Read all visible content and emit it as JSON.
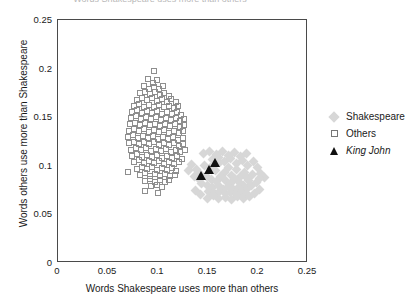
{
  "chart_data": {
    "type": "scatter",
    "title": "Words Shakespeare uses more than others",
    "xlabel": "Words Shakespeare uses more than others",
    "ylabel": "Words others use more than Shakespeare",
    "xlim": [
      0,
      0.25
    ],
    "ylim": [
      0,
      0.25
    ],
    "xticks": [
      "0",
      "0.05",
      "0.1",
      "0.15",
      "0.2",
      "0.25"
    ],
    "xtick_values": [
      0,
      0.05,
      0.1,
      0.15,
      0.2,
      0.25
    ],
    "yticks": [
      "0",
      "0.05",
      "0.1",
      "0.15",
      "0.2",
      "0.25"
    ],
    "ytick_values": [
      0,
      0.05,
      0.1,
      0.15,
      0.2,
      0.25
    ],
    "grid": false,
    "legend_position": "right",
    "series": [
      {
        "name": "Shakespeare",
        "marker": "diamond",
        "color": "#d7d7d7",
        "points": [
          [
            0.1465,
            0.1005
          ],
          [
            0.152,
            0.098
          ],
          [
            0.1575,
            0.0955
          ],
          [
            0.161,
            0.103
          ],
          [
            0.166,
            0.093
          ],
          [
            0.17,
            0.0985
          ],
          [
            0.1735,
            0.0905
          ],
          [
            0.178,
            0.096
          ],
          [
            0.182,
            0.089
          ],
          [
            0.186,
            0.0935
          ],
          [
            0.1895,
            0.0865
          ],
          [
            0.194,
            0.091
          ],
          [
            0.138,
            0.096
          ],
          [
            0.1425,
            0.0915
          ],
          [
            0.148,
            0.0885
          ],
          [
            0.153,
            0.086
          ],
          [
            0.158,
            0.0835
          ],
          [
            0.1625,
            0.089
          ],
          [
            0.1675,
            0.0845
          ],
          [
            0.172,
            0.082
          ],
          [
            0.1765,
            0.087
          ],
          [
            0.181,
            0.0825
          ],
          [
            0.1855,
            0.08
          ],
          [
            0.19,
            0.0845
          ],
          [
            0.143,
            0.082
          ],
          [
            0.149,
            0.0795
          ],
          [
            0.1545,
            0.0775
          ],
          [
            0.16,
            0.08
          ],
          [
            0.165,
            0.076
          ],
          [
            0.17,
            0.0785
          ],
          [
            0.175,
            0.0755
          ],
          [
            0.18,
            0.078
          ],
          [
            0.1845,
            0.0745
          ],
          [
            0.189,
            0.077
          ],
          [
            0.1935,
            0.08
          ],
          [
            0.198,
            0.083
          ],
          [
            0.15,
            0.0735
          ],
          [
            0.156,
            0.072
          ],
          [
            0.1615,
            0.074
          ],
          [
            0.167,
            0.0715
          ],
          [
            0.1725,
            0.073
          ],
          [
            0.178,
            0.0705
          ],
          [
            0.1835,
            0.0725
          ],
          [
            0.1885,
            0.07
          ],
          [
            0.1545,
            0.106
          ],
          [
            0.1605,
            0.1085
          ],
          [
            0.1665,
            0.1045
          ],
          [
            0.1725,
            0.107
          ],
          [
            0.1785,
            0.102
          ],
          [
            0.184,
            0.1055
          ],
          [
            0.1895,
            0.1005
          ],
          [
            0.195,
            0.104
          ],
          [
            0.199,
            0.0985
          ],
          [
            0.2025,
            0.0925
          ],
          [
            0.206,
            0.088
          ],
          [
            0.201,
            0.0865
          ],
          [
            0.1335,
            0.1015
          ],
          [
            0.13,
            0.0955
          ],
          [
            0.1365,
            0.089
          ],
          [
            0.141,
            0.0855
          ],
          [
            0.1455,
            0.113
          ],
          [
            0.1515,
            0.115
          ],
          [
            0.158,
            0.112
          ],
          [
            0.164,
            0.1145
          ],
          [
            0.1705,
            0.111
          ],
          [
            0.1765,
            0.1135
          ],
          [
            0.1825,
            0.1095
          ],
          [
            0.188,
            0.1125
          ],
          [
            0.1605,
            0.066
          ],
          [
            0.167,
            0.0675
          ],
          [
            0.1735,
            0.0655
          ],
          [
            0.1795,
            0.068
          ],
          [
            0.1855,
            0.066
          ],
          [
            0.191,
            0.0685
          ],
          [
            0.1965,
            0.072
          ],
          [
            0.2015,
            0.076
          ],
          [
            0.149,
            0.066
          ],
          [
            0.1555,
            0.069
          ],
          [
            0.142,
            0.0705
          ],
          [
            0.137,
            0.0745
          ]
        ]
      },
      {
        "name": "Others",
        "marker": "open-square",
        "color": "#8e8e8e",
        "points": [
          [
            0.0955,
            0.1975
          ],
          [
            0.09,
            0.189
          ],
          [
            0.0945,
            0.1855
          ],
          [
            0.099,
            0.188
          ],
          [
            0.0855,
            0.182
          ],
          [
            0.0905,
            0.1795
          ],
          [
            0.0955,
            0.181
          ],
          [
            0.1005,
            0.1785
          ],
          [
            0.105,
            0.1825
          ],
          [
            0.0815,
            0.1745
          ],
          [
            0.0865,
            0.176
          ],
          [
            0.0915,
            0.1735
          ],
          [
            0.0965,
            0.1755
          ],
          [
            0.1015,
            0.1725
          ],
          [
            0.106,
            0.175
          ],
          [
            0.1105,
            0.172
          ],
          [
            0.0785,
            0.168
          ],
          [
            0.0835,
            0.17
          ],
          [
            0.0885,
            0.1675
          ],
          [
            0.0935,
            0.1695
          ],
          [
            0.0985,
            0.1665
          ],
          [
            0.1035,
            0.169
          ],
          [
            0.1085,
            0.166
          ],
          [
            0.113,
            0.1685
          ],
          [
            0.1175,
            0.1655
          ],
          [
            0.076,
            0.1615
          ],
          [
            0.081,
            0.1635
          ],
          [
            0.086,
            0.161
          ],
          [
            0.091,
            0.163
          ],
          [
            0.096,
            0.1605
          ],
          [
            0.101,
            0.1625
          ],
          [
            0.106,
            0.16
          ],
          [
            0.111,
            0.162
          ],
          [
            0.1155,
            0.1595
          ],
          [
            0.12,
            0.1615
          ],
          [
            0.074,
            0.1555
          ],
          [
            0.079,
            0.157
          ],
          [
            0.084,
            0.1545
          ],
          [
            0.089,
            0.1565
          ],
          [
            0.094,
            0.154
          ],
          [
            0.099,
            0.156
          ],
          [
            0.104,
            0.1535
          ],
          [
            0.109,
            0.1555
          ],
          [
            0.114,
            0.153
          ],
          [
            0.1185,
            0.155
          ],
          [
            0.123,
            0.1525
          ],
          [
            0.0725,
            0.149
          ],
          [
            0.0775,
            0.151
          ],
          [
            0.0825,
            0.1485
          ],
          [
            0.0875,
            0.1505
          ],
          [
            0.0925,
            0.148
          ],
          [
            0.0975,
            0.15
          ],
          [
            0.1025,
            0.1475
          ],
          [
            0.1075,
            0.1495
          ],
          [
            0.1125,
            0.147
          ],
          [
            0.1175,
            0.149
          ],
          [
            0.122,
            0.1465
          ],
          [
            0.126,
            0.1485
          ],
          [
            0.0715,
            0.1425
          ],
          [
            0.0765,
            0.1445
          ],
          [
            0.0815,
            0.142
          ],
          [
            0.0865,
            0.144
          ],
          [
            0.0915,
            0.1415
          ],
          [
            0.0965,
            0.1435
          ],
          [
            0.1015,
            0.141
          ],
          [
            0.1065,
            0.143
          ],
          [
            0.1115,
            0.1405
          ],
          [
            0.1165,
            0.1425
          ],
          [
            0.1215,
            0.14
          ],
          [
            0.1255,
            0.142
          ],
          [
            0.0705,
            0.136
          ],
          [
            0.0755,
            0.138
          ],
          [
            0.0805,
            0.1355
          ],
          [
            0.0855,
            0.1375
          ],
          [
            0.0905,
            0.135
          ],
          [
            0.0955,
            0.137
          ],
          [
            0.1005,
            0.1345
          ],
          [
            0.1055,
            0.1365
          ],
          [
            0.1105,
            0.134
          ],
          [
            0.1155,
            0.136
          ],
          [
            0.1205,
            0.1335
          ],
          [
            0.125,
            0.1355
          ],
          [
            0.07,
            0.1295
          ],
          [
            0.075,
            0.1315
          ],
          [
            0.08,
            0.129
          ],
          [
            0.085,
            0.131
          ],
          [
            0.09,
            0.1285
          ],
          [
            0.095,
            0.1305
          ],
          [
            0.1,
            0.128
          ],
          [
            0.105,
            0.13
          ],
          [
            0.11,
            0.1275
          ],
          [
            0.115,
            0.1295
          ],
          [
            0.12,
            0.127
          ],
          [
            0.1245,
            0.129
          ],
          [
            0.071,
            0.123
          ],
          [
            0.076,
            0.125
          ],
          [
            0.081,
            0.1225
          ],
          [
            0.086,
            0.1245
          ],
          [
            0.091,
            0.122
          ],
          [
            0.096,
            0.124
          ],
          [
            0.101,
            0.1215
          ],
          [
            0.106,
            0.1235
          ],
          [
            0.111,
            0.121
          ],
          [
            0.116,
            0.123
          ],
          [
            0.1205,
            0.1205
          ],
          [
            0.125,
            0.1225
          ],
          [
            0.0725,
            0.1165
          ],
          [
            0.0775,
            0.1185
          ],
          [
            0.0825,
            0.116
          ],
          [
            0.0875,
            0.118
          ],
          [
            0.0925,
            0.1155
          ],
          [
            0.0975,
            0.1175
          ],
          [
            0.1025,
            0.115
          ],
          [
            0.1075,
            0.117
          ],
          [
            0.1125,
            0.1145
          ],
          [
            0.1175,
            0.1165
          ],
          [
            0.122,
            0.114
          ],
          [
            0.1265,
            0.116
          ],
          [
            0.074,
            0.11
          ],
          [
            0.079,
            0.112
          ],
          [
            0.084,
            0.1095
          ],
          [
            0.089,
            0.1115
          ],
          [
            0.094,
            0.109
          ],
          [
            0.099,
            0.111
          ],
          [
            0.104,
            0.1085
          ],
          [
            0.109,
            0.1105
          ],
          [
            0.114,
            0.108
          ],
          [
            0.119,
            0.11
          ],
          [
            0.1235,
            0.1075
          ],
          [
            0.076,
            0.1035
          ],
          [
            0.081,
            0.1055
          ],
          [
            0.086,
            0.103
          ],
          [
            0.091,
            0.105
          ],
          [
            0.096,
            0.1025
          ],
          [
            0.101,
            0.1045
          ],
          [
            0.106,
            0.102
          ],
          [
            0.111,
            0.104
          ],
          [
            0.116,
            0.1015
          ],
          [
            0.1205,
            0.1035
          ],
          [
            0.0785,
            0.097
          ],
          [
            0.0835,
            0.099
          ],
          [
            0.0885,
            0.0965
          ],
          [
            0.0935,
            0.0985
          ],
          [
            0.0985,
            0.096
          ],
          [
            0.1035,
            0.098
          ],
          [
            0.1085,
            0.0955
          ],
          [
            0.1135,
            0.0975
          ],
          [
            0.118,
            0.095
          ],
          [
            0.082,
            0.0905
          ],
          [
            0.087,
            0.0925
          ],
          [
            0.092,
            0.09
          ],
          [
            0.097,
            0.092
          ],
          [
            0.102,
            0.0895
          ],
          [
            0.107,
            0.0915
          ],
          [
            0.112,
            0.089
          ],
          [
            0.1165,
            0.091
          ],
          [
            0.07,
            0.0935
          ],
          [
            0.0865,
            0.0845
          ],
          [
            0.0915,
            0.086
          ],
          [
            0.0965,
            0.0835
          ],
          [
            0.1015,
            0.0855
          ],
          [
            0.1065,
            0.083
          ],
          [
            0.111,
            0.085
          ],
          [
            0.093,
            0.079
          ],
          [
            0.0985,
            0.0805
          ],
          [
            0.1035,
            0.078
          ],
          [
            0.087,
            0.0745
          ],
          [
            0.1,
            0.072
          ]
        ]
      },
      {
        "name": "King John",
        "marker": "filled-triangle",
        "color": "#111111",
        "italic": true,
        "points": [
          [
            0.143,
            0.09
          ],
          [
            0.1505,
            0.096
          ],
          [
            0.157,
            0.103
          ]
        ]
      }
    ]
  },
  "legend": {
    "items": [
      {
        "label": "Shakespeare",
        "marker": "diamond",
        "italic": false
      },
      {
        "label": "Others",
        "marker": "open-square",
        "italic": false
      },
      {
        "label": "King John",
        "marker": "filled-triangle",
        "italic": true
      }
    ]
  }
}
